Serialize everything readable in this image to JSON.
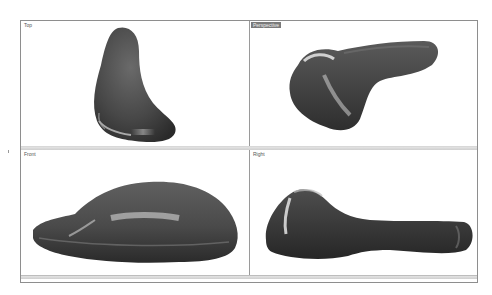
{
  "viewports": [
    {
      "id": "top",
      "label": "Top",
      "active": false
    },
    {
      "id": "perspective",
      "label": "Perspective",
      "active": true
    },
    {
      "id": "front",
      "label": "Front",
      "active": false
    },
    {
      "id": "right",
      "label": "Right",
      "active": false
    }
  ],
  "status": {
    "top_bar": "",
    "bottom_bar": ""
  },
  "colors": {
    "shape_fill": "#4a4a4a",
    "frame_border": "#8e8e8e",
    "active_label_bg": "#7a7a7a"
  }
}
